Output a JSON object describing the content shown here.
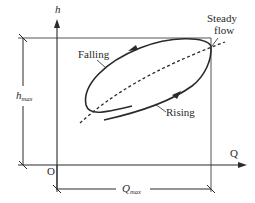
{
  "diagram": {
    "type": "hysteresis rating curve (loop rating curve)",
    "axes": {
      "y_label": "h",
      "x_label": "Q",
      "origin_label": "O"
    },
    "dimensions": {
      "h_max": {
        "main": "h",
        "sub": "max"
      },
      "Q_max": {
        "main": "Q",
        "sub": "max"
      }
    },
    "curve_labels": {
      "falling": "Falling",
      "rising": "Rising",
      "steady_line1": "Steady",
      "steady_line2": "flow"
    },
    "colors": {
      "line": "#2a2a2a",
      "frame": "#555555",
      "background": "#ffffff"
    }
  }
}
